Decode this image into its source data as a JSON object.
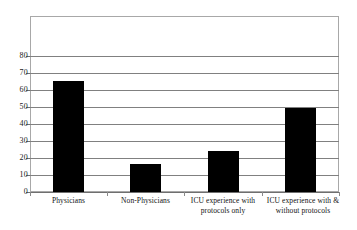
{
  "chart_data": {
    "type": "bar",
    "title": "",
    "subtitle": "",
    "xlabel": "",
    "ylabel": "",
    "ylim": [
      0,
      90
    ],
    "yticks": [
      0,
      10,
      20,
      30,
      40,
      50,
      60,
      70,
      80
    ],
    "grid": true,
    "legend": false,
    "legend_position": "none",
    "bar_color": "#000000",
    "grid_color": "#808080",
    "frame_color": "#a8a8a8",
    "categories": [
      "Physicians",
      "Non-Physicians",
      "ICU experience with protocols only",
      "ICU experience with & without protocols"
    ],
    "category_lines": [
      [
        "Physicians"
      ],
      [
        "Non-Physicians"
      ],
      [
        "ICU experience with",
        "protocols only"
      ],
      [
        "ICU experience with &",
        "without protocols"
      ]
    ],
    "values": [
      69.5,
      17.5,
      25.5,
      52.5
    ]
  },
  "axis": {
    "y_tick_0": "0",
    "y_tick_1": "10",
    "y_tick_2": "20",
    "y_tick_3": "30",
    "y_tick_4": "40",
    "y_tick_5": "50",
    "y_tick_6": "60",
    "y_tick_7": "70",
    "y_tick_8": "80"
  },
  "labels": {
    "cat0_line0": "Physicians",
    "cat1_line0": "Non-Physicians",
    "cat2_line0": "ICU experience with",
    "cat2_line1": "protocols only",
    "cat3_line0": "ICU experience with &",
    "cat3_line1": "without protocols"
  }
}
